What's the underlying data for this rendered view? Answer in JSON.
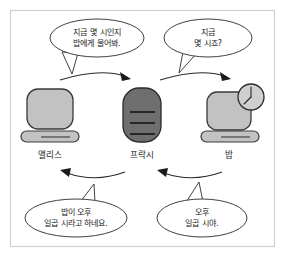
{
  "diagram": {
    "border_color": "#d0d0d0",
    "background_color": "#ffffff"
  },
  "nodes": [
    {
      "id": "alice",
      "label": "앨리스",
      "icon": "desktop-computer-icon",
      "screen_color": "#c2c2c2",
      "outline_color": "#3a3a3a"
    },
    {
      "id": "proxy",
      "label": "프락시",
      "icon": "proxy-server-icon",
      "screen_color": "#6e6e6e",
      "outline_color": "#2a2a2a",
      "line_count": 3
    },
    {
      "id": "bob",
      "label": "밥",
      "icon": "desktop-computer-with-clock-icon",
      "screen_color": "#c2c2c2",
      "outline_color": "#3a3a3a",
      "clock": {
        "icon": "clock-icon",
        "hour_label": "7",
        "face_color": "#cfcfcf"
      }
    }
  ],
  "bubbles": [
    {
      "id": "alice-request",
      "speaker": "앨리스",
      "lines": [
        "지금 몇 시인지",
        "밥에게 물어봐."
      ]
    },
    {
      "id": "proxy-request",
      "speaker": "프락시",
      "lines": [
        "지금",
        "몇 시죠?"
      ]
    },
    {
      "id": "proxy-reply",
      "speaker": "프락시",
      "lines": [
        "밥이 오후",
        "일곱 시라고 하네요."
      ]
    },
    {
      "id": "bob-reply",
      "speaker": "밥",
      "lines": [
        "오후",
        "일곱 시야."
      ]
    }
  ],
  "arrows": [
    {
      "id": "alice-to-proxy",
      "direction": "right",
      "position": "top"
    },
    {
      "id": "proxy-to-bob",
      "direction": "right",
      "position": "top"
    },
    {
      "id": "proxy-to-alice",
      "direction": "left",
      "position": "bottom"
    },
    {
      "id": "bob-to-proxy",
      "direction": "left",
      "position": "bottom"
    }
  ]
}
